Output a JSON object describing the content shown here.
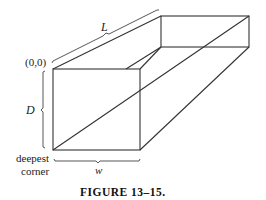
{
  "figure": {
    "caption": "FIGURE 13–15.",
    "labels": {
      "length": "L",
      "depth": "D",
      "width": "w",
      "origin": "(0,0)",
      "deepest_line1": "deepest",
      "deepest_line2": "corner"
    }
  }
}
